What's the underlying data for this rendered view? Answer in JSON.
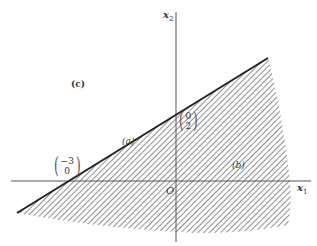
{
  "figure": {
    "axes": {
      "x_label": "x",
      "x_sub": "1",
      "y_label": "x",
      "y_sub": "2",
      "origin_label": "O"
    },
    "region_labels": {
      "a": "(a)",
      "b": "(b)",
      "c": "(c)"
    },
    "points": [
      {
        "name": "x-intercept",
        "top": "−3",
        "bottom": "0"
      },
      {
        "name": "y-intercept",
        "top": "0",
        "bottom": "2"
      }
    ],
    "colors": {
      "line": "#222222",
      "axis": "#555555",
      "hatch": "#777777"
    }
  }
}
